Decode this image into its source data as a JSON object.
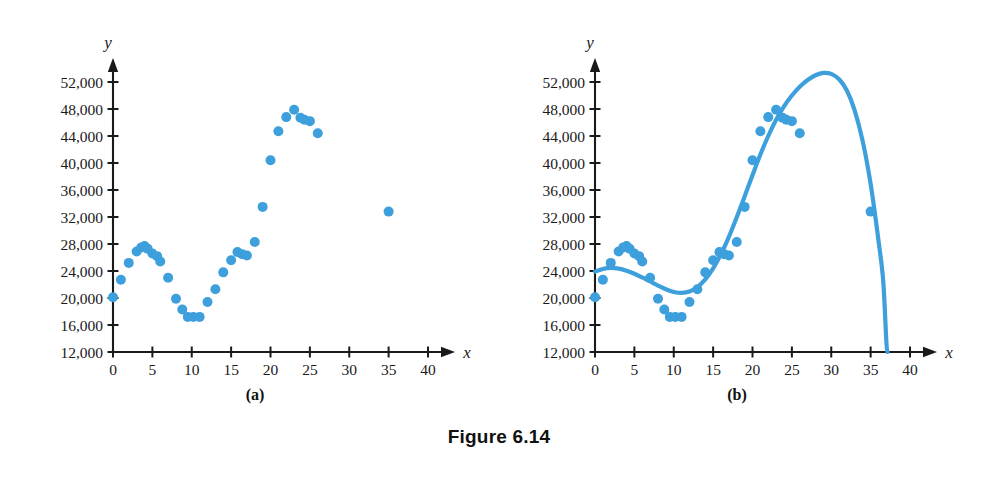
{
  "figure": {
    "caption": "Figure 6.14",
    "panel_a_label": "(a)",
    "panel_b_label": "(b)"
  },
  "chart_data": [
    {
      "type": "scatter",
      "panel": "(a)",
      "title": "",
      "xlabel": "x",
      "ylabel": "y",
      "xlim": [
        0,
        43
      ],
      "ylim": [
        12000,
        55000
      ],
      "xticks": [
        0,
        5,
        10,
        15,
        20,
        25,
        30,
        35,
        40
      ],
      "xtick_labels": [
        "0",
        "5",
        "10",
        "15",
        "20",
        "25",
        "30",
        "35",
        "40"
      ],
      "yticks": [
        12000,
        16000,
        20000,
        24000,
        28000,
        32000,
        36000,
        40000,
        44000,
        48000,
        52000
      ],
      "ytick_labels": [
        "12,000",
        "16,000",
        "20,000",
        "24,000",
        "28,000",
        "32,000",
        "36,000",
        "40,000",
        "44,000",
        "48,000",
        "52,000"
      ],
      "grid": false,
      "legend": "none",
      "marker_color": "#3d9fdb",
      "points": [
        [
          0,
          20100
        ],
        [
          1,
          22700
        ],
        [
          2,
          25200
        ],
        [
          3,
          26900
        ],
        [
          3.6,
          27500
        ],
        [
          4,
          27700
        ],
        [
          4.4,
          27300
        ],
        [
          5,
          26600
        ],
        [
          5.6,
          26200
        ],
        [
          6,
          25400
        ],
        [
          7,
          23000
        ],
        [
          8,
          19900
        ],
        [
          8.8,
          18300
        ],
        [
          9.5,
          17200
        ],
        [
          10.2,
          17200
        ],
        [
          11,
          17200
        ],
        [
          12,
          19400
        ],
        [
          13,
          21300
        ],
        [
          14,
          23800
        ],
        [
          15,
          25600
        ],
        [
          15.8,
          26800
        ],
        [
          16.4,
          26500
        ],
        [
          17,
          26300
        ],
        [
          18,
          28300
        ],
        [
          19,
          33500
        ],
        [
          20,
          40400
        ],
        [
          21,
          44700
        ],
        [
          22,
          46800
        ],
        [
          23,
          47900
        ],
        [
          23.8,
          46700
        ],
        [
          24.3,
          46400
        ],
        [
          25,
          46200
        ],
        [
          26,
          44400
        ],
        [
          35,
          32800
        ]
      ]
    },
    {
      "type": "scatter",
      "panel": "(b)",
      "title": "",
      "xlabel": "x",
      "ylabel": "y",
      "xlim": [
        0,
        43
      ],
      "ylim": [
        12000,
        55000
      ],
      "xticks": [
        0,
        5,
        10,
        15,
        20,
        25,
        30,
        35,
        40
      ],
      "xtick_labels": [
        "0",
        "5",
        "10",
        "15",
        "20",
        "25",
        "30",
        "35",
        "40"
      ],
      "yticks": [
        12000,
        16000,
        20000,
        24000,
        28000,
        32000,
        36000,
        40000,
        44000,
        48000,
        52000
      ],
      "ytick_labels": [
        "12,000",
        "16,000",
        "20,000",
        "24,000",
        "28,000",
        "32,000",
        "36,000",
        "40,000",
        "44,000",
        "48,000",
        "52,000"
      ],
      "grid": false,
      "legend": "none",
      "marker_color": "#3d9fdb",
      "curve_color": "#3d9fdb",
      "points": [
        [
          0,
          20100
        ],
        [
          1,
          22700
        ],
        [
          2,
          25200
        ],
        [
          3,
          26900
        ],
        [
          3.6,
          27500
        ],
        [
          4,
          27700
        ],
        [
          4.4,
          27300
        ],
        [
          5,
          26600
        ],
        [
          5.6,
          26200
        ],
        [
          6,
          25400
        ],
        [
          7,
          23000
        ],
        [
          8,
          19900
        ],
        [
          8.8,
          18300
        ],
        [
          9.5,
          17200
        ],
        [
          10.2,
          17200
        ],
        [
          11,
          17200
        ],
        [
          12,
          19400
        ],
        [
          13,
          21300
        ],
        [
          14,
          23800
        ],
        [
          15,
          25600
        ],
        [
          15.8,
          26800
        ],
        [
          16.4,
          26500
        ],
        [
          17,
          26300
        ],
        [
          18,
          28300
        ],
        [
          19,
          33500
        ],
        [
          20,
          40400
        ],
        [
          21,
          44700
        ],
        [
          22,
          46800
        ],
        [
          23,
          47900
        ],
        [
          23.8,
          46700
        ],
        [
          24.3,
          46400
        ],
        [
          25,
          46200
        ],
        [
          26,
          44400
        ],
        [
          35,
          32800
        ]
      ],
      "fit_curve": [
        [
          0,
          23900
        ],
        [
          1,
          24300
        ],
        [
          2,
          24450
        ],
        [
          3,
          24350
        ],
        [
          4,
          24050
        ],
        [
          5,
          23600
        ],
        [
          6,
          23050
        ],
        [
          7,
          22450
        ],
        [
          8,
          21850
        ],
        [
          9,
          21300
        ],
        [
          10,
          20900
        ],
        [
          11,
          20750
        ],
        [
          12,
          20950
        ],
        [
          13,
          21600
        ],
        [
          14,
          22750
        ],
        [
          15,
          24400
        ],
        [
          16,
          26500
        ],
        [
          17,
          29050
        ],
        [
          18,
          31950
        ],
        [
          19,
          35050
        ],
        [
          20,
          38200
        ],
        [
          21,
          41250
        ],
        [
          22,
          44000
        ],
        [
          23,
          46400
        ],
        [
          24,
          48400
        ],
        [
          25,
          50000
        ],
        [
          26,
          51300
        ],
        [
          27,
          52300
        ],
        [
          28,
          53000
        ],
        [
          29,
          53350
        ],
        [
          30,
          53200
        ],
        [
          31,
          52400
        ],
        [
          32,
          50700
        ],
        [
          33,
          47700
        ],
        [
          34,
          43200
        ],
        [
          35,
          36900
        ],
        [
          36,
          28500
        ],
        [
          36.6,
          22500
        ],
        [
          37.0,
          13500
        ],
        [
          37.15,
          12000
        ]
      ]
    }
  ]
}
